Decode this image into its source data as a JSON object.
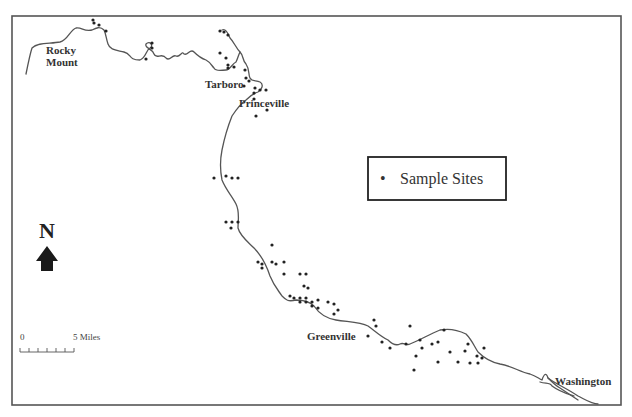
{
  "map": {
    "frame": {
      "x": 12,
      "y": 16,
      "width": 609,
      "height": 389
    },
    "colors": {
      "river": "#555555",
      "site": "#222222",
      "text": "#333333"
    },
    "rivers": [
      "M26,74 C28,64 30,54 32,48 C38,42 50,44 60,42 C68,40 70,30 76,28 C82,27 84,32 92,30 C96,28 100,26 104,30 C106,34 106,38 108,44 C110,50 116,50 124,52 C132,54 128,60 140,60 C146,58 146,50 150,48 C154,46 150,40 146,44 C144,48 152,48 154,54 C156,60 162,52 166,58 C170,62 172,54 176,56 C180,58 182,50 184,54 C188,56 190,48 194,52 C198,56 200,58 206,60 C210,62 212,66 214,68 C216,72 222,70 226,70 C230,70 232,64 236,62 C238,58 238,56 240,52",
      "M222,30 C226,28 228,34 230,38 C234,42 236,48 240,52 C244,56 242,60 246,64 C250,70 248,74 250,78 C252,82 256,80 260,82 C264,84 262,90 258,92 C252,94 250,96 246,100 C240,104 236,110 232,116 C228,126 224,140 222,150 C220,160 220,170 222,180 C226,190 232,196 236,204 C240,212 238,220 238,228 C240,236 248,242 254,248 C262,256 266,264 270,276 C274,286 278,290 282,296 C286,300 288,302 296,300 C304,300 310,302 314,306 C318,312 324,318 336,320 C348,322 360,322 368,326 C374,330 380,336 388,340 C392,344 396,346 400,344 C404,342 406,346 410,344 C420,340 430,334 440,330 C450,328 458,330 466,334 C472,340 474,346 478,352 C484,358 490,362 500,364 C512,366 520,372 530,374 C536,376 538,378 542,380 C544,374 546,372 548,378 C552,382 556,386 560,388 C566,392 572,396 578,400",
      "M540,382 C546,384 550,382 552,386 C560,392 568,394 574,396",
      "M548,378 C556,384 566,388 578,396 C586,400 592,404 598,404"
    ],
    "sample_sites": [
      [
        93,
        20
      ],
      [
        94,
        23
      ],
      [
        99,
        25
      ],
      [
        106,
        31
      ],
      [
        152,
        43
      ],
      [
        152,
        48
      ],
      [
        146,
        59
      ],
      [
        220,
        31
      ],
      [
        224,
        32
      ],
      [
        228,
        35
      ],
      [
        220,
        53
      ],
      [
        226,
        58
      ],
      [
        228,
        65
      ],
      [
        228,
        68
      ],
      [
        234,
        67
      ],
      [
        245,
        70
      ],
      [
        246,
        78
      ],
      [
        244,
        86
      ],
      [
        249,
        81
      ],
      [
        255,
        88
      ],
      [
        260,
        90
      ],
      [
        266,
        90
      ],
      [
        254,
        93
      ],
      [
        254,
        99
      ],
      [
        267,
        110
      ],
      [
        256,
        116
      ],
      [
        214,
        178
      ],
      [
        226,
        176
      ],
      [
        232,
        178
      ],
      [
        238,
        178
      ],
      [
        226,
        222
      ],
      [
        232,
        222
      ],
      [
        238,
        222
      ],
      [
        231,
        228
      ],
      [
        272,
        245
      ],
      [
        258,
        262
      ],
      [
        262,
        264
      ],
      [
        262,
        268
      ],
      [
        272,
        262
      ],
      [
        276,
        264
      ],
      [
        284,
        262
      ],
      [
        284,
        274
      ],
      [
        300,
        274
      ],
      [
        306,
        274
      ],
      [
        304,
        286
      ],
      [
        308,
        288
      ],
      [
        290,
        296
      ],
      [
        294,
        298
      ],
      [
        300,
        298
      ],
      [
        306,
        298
      ],
      [
        300,
        302
      ],
      [
        306,
        302
      ],
      [
        312,
        302
      ],
      [
        318,
        300
      ],
      [
        312,
        306
      ],
      [
        318,
        308
      ],
      [
        328,
        302
      ],
      [
        334,
        304
      ],
      [
        334,
        314
      ],
      [
        338,
        310
      ],
      [
        374,
        320
      ],
      [
        376,
        326
      ],
      [
        368,
        336
      ],
      [
        382,
        342
      ],
      [
        390,
        348
      ],
      [
        406,
        344
      ],
      [
        410,
        326
      ],
      [
        420,
        340
      ],
      [
        422,
        348
      ],
      [
        416,
        356
      ],
      [
        432,
        344
      ],
      [
        438,
        342
      ],
      [
        444,
        330
      ],
      [
        450,
        352
      ],
      [
        465,
        351
      ],
      [
        468,
        344
      ],
      [
        477,
        356
      ],
      [
        478,
        363
      ],
      [
        484,
        348
      ],
      [
        482,
        358
      ],
      [
        438,
        362
      ],
      [
        414,
        370
      ],
      [
        458,
        362
      ],
      [
        470,
        363
      ]
    ],
    "cities": [
      {
        "name": "Rocky",
        "x": 46,
        "y": 54
      },
      {
        "name": "Mount",
        "x": 46,
        "y": 66
      },
      {
        "name": "Tarboro",
        "x": 205,
        "y": 88
      },
      {
        "name": "Princeville",
        "x": 239,
        "y": 107
      },
      {
        "name": "Greenville",
        "x": 307,
        "y": 340
      },
      {
        "name": "Washington",
        "x": 555,
        "y": 385
      }
    ],
    "legend": {
      "x": 368,
      "y": 157,
      "width": 138,
      "height": 43,
      "symbol": "•",
      "label": "Sample Sites"
    },
    "north_arrow": {
      "letter": "N",
      "x": 47,
      "y": 238
    },
    "scale_bar": {
      "x": 20,
      "y": 340,
      "length": 54,
      "start_label": "0",
      "end_label": "5",
      "unit_label": "Miles",
      "ticks": 6
    }
  }
}
